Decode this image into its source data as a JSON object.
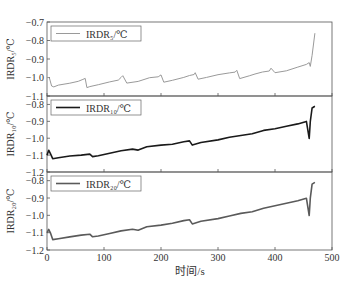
{
  "chart_data": {
    "type": "line",
    "layout": "3 vertically stacked panels sharing x-axis",
    "xlabel": "时间/s",
    "xlim": [
      0,
      500
    ],
    "xticks": [
      0,
      100,
      200,
      300,
      400,
      500
    ],
    "grid": false,
    "legend_position": "upper left (each panel)",
    "panels": [
      {
        "ylabel": "IRDR₅/℃",
        "legend": "IRDR₅/℃",
        "color": "#9a9a9a",
        "ylim": [
          -1.1,
          -0.7
        ],
        "yticks": [
          -0.7,
          -0.8,
          -0.9,
          -1.0,
          -1.1
        ],
        "x": [
          0,
          4,
          8,
          12,
          20,
          40,
          55,
          63,
          67,
          70,
          75,
          90,
          110,
          125,
          130,
          133,
          140,
          160,
          180,
          195,
          200,
          205,
          220,
          240,
          250,
          258,
          260,
          265,
          280,
          300,
          320,
          330,
          333,
          338,
          355,
          365,
          378,
          390,
          393,
          400,
          420,
          440,
          455,
          460,
          462,
          465,
          470
        ],
        "y": [
          -1.0,
          -1.0,
          -1.045,
          -1.05,
          -1.04,
          -1.03,
          -1.02,
          -1.01,
          -1.005,
          -1.055,
          -1.05,
          -1.04,
          -1.025,
          -1.015,
          -1.0,
          -0.99,
          -1.03,
          -1.02,
          -1.0,
          -0.995,
          -0.985,
          -1.025,
          -1.015,
          -1.0,
          -0.99,
          -0.985,
          -0.975,
          -1.01,
          -1.0,
          -0.985,
          -0.975,
          -0.97,
          -0.96,
          -1.005,
          -0.99,
          -0.98,
          -0.97,
          -0.965,
          -0.95,
          -0.975,
          -0.965,
          -0.945,
          -0.93,
          -0.92,
          -0.94,
          -0.88,
          -0.76
        ]
      },
      {
        "ylabel": "IRDR₁₀/℃",
        "legend": "IRDR₁₀/℃",
        "color": "#1a1a1a",
        "ylim": [
          -1.2,
          -0.75
        ],
        "yticks": [
          -0.8,
          -0.9,
          -1.0,
          -1.1,
          -1.2
        ],
        "x": [
          0,
          3,
          6,
          10,
          20,
          40,
          60,
          75,
          80,
          90,
          110,
          130,
          150,
          160,
          175,
          200,
          220,
          240,
          250,
          255,
          270,
          300,
          320,
          340,
          360,
          380,
          400,
          420,
          440,
          455,
          460,
          462,
          465,
          470
        ],
        "y": [
          -1.1,
          -1.07,
          -1.09,
          -1.12,
          -1.115,
          -1.105,
          -1.1,
          -1.095,
          -1.11,
          -1.105,
          -1.09,
          -1.075,
          -1.065,
          -1.07,
          -1.05,
          -1.04,
          -1.035,
          -1.02,
          -1.015,
          -1.04,
          -1.025,
          -1.01,
          -0.995,
          -0.985,
          -0.975,
          -0.955,
          -0.945,
          -0.93,
          -0.915,
          -0.9,
          -1.0,
          -0.9,
          -0.82,
          -0.81
        ]
      },
      {
        "ylabel": "IRDR₂₀/℃",
        "legend": "IRDR₂₀/℃",
        "color": "#5a5a5a",
        "ylim": [
          -1.2,
          -0.75
        ],
        "yticks": [
          -0.8,
          -0.9,
          -1.0,
          -1.1,
          -1.2
        ],
        "x": [
          0,
          3,
          6,
          10,
          20,
          40,
          60,
          75,
          80,
          90,
          110,
          130,
          150,
          160,
          175,
          200,
          220,
          240,
          250,
          255,
          270,
          300,
          320,
          340,
          360,
          380,
          400,
          420,
          440,
          455,
          460,
          462,
          465,
          470
        ],
        "y": [
          -1.1,
          -1.08,
          -1.1,
          -1.14,
          -1.135,
          -1.125,
          -1.115,
          -1.11,
          -1.125,
          -1.12,
          -1.105,
          -1.09,
          -1.08,
          -1.085,
          -1.065,
          -1.055,
          -1.045,
          -1.03,
          -1.025,
          -1.05,
          -1.035,
          -1.02,
          -1.005,
          -0.99,
          -0.98,
          -0.96,
          -0.945,
          -0.93,
          -0.915,
          -0.9,
          -1.0,
          -0.9,
          -0.82,
          -0.81
        ]
      }
    ]
  }
}
